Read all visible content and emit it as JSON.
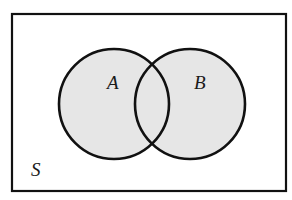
{
  "diagram": {
    "type": "venn",
    "universe": {
      "label": "S",
      "x": 12,
      "y": 14,
      "width": 274,
      "height": 177,
      "stroke": "#111111",
      "fill": "#ffffff"
    },
    "sets": [
      {
        "label": "A",
        "cx": 114,
        "cy": 104,
        "r": 55,
        "fill": "#e6e6e6",
        "stroke": "#111111",
        "label_x": 107,
        "label_y": 89
      },
      {
        "label": "B",
        "cx": 190,
        "cy": 104,
        "r": 55,
        "fill": "#e6e6e6",
        "stroke": "#111111",
        "label_x": 194,
        "label_y": 89
      }
    ],
    "universe_label_pos": {
      "x": 31,
      "y": 176
    }
  }
}
